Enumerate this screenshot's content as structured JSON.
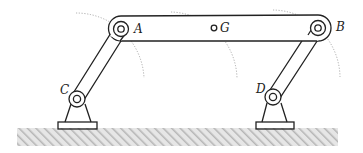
{
  "diagram": {
    "labels": {
      "A": "A",
      "B": "B",
      "C": "C",
      "D": "D",
      "G": "G"
    },
    "points": {
      "A": [
        121,
        29
      ],
      "B": [
        318,
        28
      ],
      "C": [
        77,
        99
      ],
      "D": [
        273,
        97
      ],
      "G": [
        214,
        28
      ]
    },
    "components": [
      {
        "id": "coupler-AB",
        "type": "link",
        "description": "Coupler bar connecting pins A and B, with mass center G"
      },
      {
        "id": "crank-CA",
        "type": "link",
        "description": "Link from fixed pivot C to pin A"
      },
      {
        "id": "rocker-DB",
        "type": "link",
        "description": "Link from fixed pivot D to pin B"
      },
      {
        "id": "support-C",
        "type": "fixed-support",
        "description": "Pinned support at C on ground"
      },
      {
        "id": "support-D",
        "type": "fixed-support",
        "description": "Pinned support at D on ground"
      },
      {
        "id": "ground",
        "type": "hatched-ground"
      }
    ],
    "motion_paths": [
      {
        "about": "A",
        "style": "dashed-arc"
      },
      {
        "about": "G",
        "style": "dashed-arc"
      },
      {
        "about": "B",
        "style": "dashed-arc"
      }
    ],
    "colors": {
      "line": "#222222",
      "arc": "#999999",
      "ground_hatch": "#bdbdbd",
      "background": "#ffffff"
    }
  }
}
